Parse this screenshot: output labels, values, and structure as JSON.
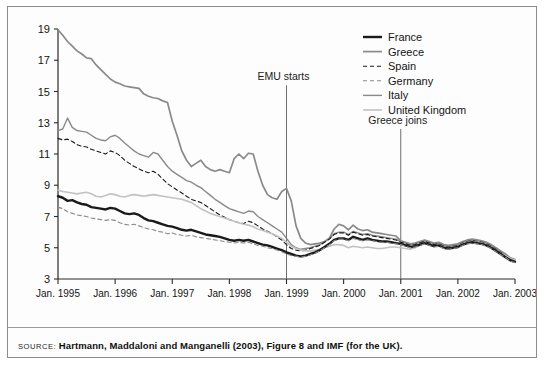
{
  "figure": {
    "source_tag": "SOURCE:",
    "source_text": "Hartmann, Maddaloni and Manganelli (2003), Figure 8 and IMF (for the UK)."
  },
  "legend": {
    "position": "top-right",
    "items": [
      {
        "label": "France",
        "color": "#1a1a1a",
        "width": 2.4,
        "dash": "none"
      },
      {
        "label": "Greece",
        "color": "#8a8a8a",
        "width": 1.7,
        "dash": "none"
      },
      {
        "label": "Spain",
        "color": "#1a1a1a",
        "width": 1.1,
        "dash": "4,3"
      },
      {
        "label": "Germany",
        "color": "#8a8a8a",
        "width": 1.1,
        "dash": "4,3"
      },
      {
        "label": "Italy",
        "color": "#8a8a8a",
        "width": 1.4,
        "dash": "none"
      },
      {
        "label": "United Kingdom",
        "color": "#c2c2c2",
        "width": 1.6,
        "dash": "none"
      }
    ]
  },
  "annotations": [
    {
      "name": "emu-starts",
      "text": "EMU starts",
      "x": 1999.0
    },
    {
      "name": "greece-joins",
      "text": "Greece joins",
      "x": 2001.0
    }
  ],
  "chart_data": {
    "type": "line",
    "title": "",
    "xlabel": "",
    "ylabel": "",
    "xlim": [
      1995.0,
      2003.0
    ],
    "ylim": [
      3,
      19
    ],
    "grid": false,
    "ytick_labels": [
      "3",
      "5",
      "7",
      "9",
      "11",
      "13",
      "15",
      "17",
      "19"
    ],
    "yticks": [
      3,
      5,
      7,
      9,
      11,
      13,
      15,
      17,
      19
    ],
    "xtick_labels": [
      "Jan. 1995",
      "Jan. 1996",
      "Jan. 1997",
      "Jan. 1998",
      "Jan. 1999",
      "Jan. 2000",
      "Jan. 2001",
      "Jan. 2002",
      "Jan. 2003"
    ],
    "xticks": [
      1995,
      1996,
      1997,
      1998,
      1999,
      2000,
      2001,
      2002,
      2003
    ],
    "x": [
      1995.0,
      1995.083,
      1995.167,
      1995.25,
      1995.333,
      1995.417,
      1995.5,
      1995.583,
      1995.667,
      1995.75,
      1995.833,
      1995.917,
      1996.0,
      1996.083,
      1996.167,
      1996.25,
      1996.333,
      1996.417,
      1996.5,
      1996.583,
      1996.667,
      1996.75,
      1996.833,
      1996.917,
      1997.0,
      1997.083,
      1997.167,
      1997.25,
      1997.333,
      1997.417,
      1997.5,
      1997.583,
      1997.667,
      1997.75,
      1997.833,
      1997.917,
      1998.0,
      1998.083,
      1998.167,
      1998.25,
      1998.333,
      1998.417,
      1998.5,
      1998.583,
      1998.667,
      1998.75,
      1998.833,
      1998.917,
      1999.0,
      1999.083,
      1999.167,
      1999.25,
      1999.333,
      1999.417,
      1999.5,
      1999.583,
      1999.667,
      1999.75,
      1999.833,
      1999.917,
      2000.0,
      2000.083,
      2000.167,
      2000.25,
      2000.333,
      2000.417,
      2000.5,
      2000.583,
      2000.667,
      2000.75,
      2000.833,
      2000.917,
      2001.0,
      2001.083,
      2001.167,
      2001.25,
      2001.333,
      2001.417,
      2001.5,
      2001.583,
      2001.667,
      2001.75,
      2001.833,
      2001.917,
      2002.0,
      2002.083,
      2002.167,
      2002.25,
      2002.333,
      2002.417,
      2002.5,
      2002.583,
      2002.667,
      2002.75,
      2002.833,
      2002.917,
      2003.0
    ],
    "series": [
      {
        "name": "Greece",
        "legend_ref": "Greece",
        "style": "thick-black-solid",
        "note": "Topmost line, starts near 19 and falls steeply to converge after EMU",
        "values": [
          18.95,
          18.6,
          18.2,
          17.9,
          17.6,
          17.4,
          17.15,
          17.1,
          16.7,
          16.4,
          16.1,
          15.8,
          15.6,
          15.5,
          15.35,
          15.3,
          15.25,
          15.2,
          14.85,
          14.7,
          14.6,
          14.55,
          14.4,
          14.3,
          13.1,
          12.2,
          11.2,
          10.6,
          10.2,
          10.4,
          10.6,
          10.2,
          10.0,
          9.9,
          10.0,
          9.9,
          9.8,
          10.7,
          11.0,
          10.7,
          11.05,
          11.0,
          9.9,
          9.0,
          8.4,
          8.2,
          8.1,
          8.6,
          8.8,
          8.0,
          6.4,
          5.6,
          5.3,
          5.2,
          5.25,
          5.3,
          5.4,
          5.6,
          6.2,
          6.5,
          6.4,
          6.15,
          6.45,
          6.2,
          6.1,
          6.15,
          6.0,
          5.95,
          5.9,
          5.85,
          5.8,
          5.75,
          5.45,
          5.35,
          5.25,
          5.3,
          5.4,
          5.5,
          5.4,
          5.3,
          5.35,
          5.2,
          5.15,
          5.2,
          5.25,
          5.4,
          5.5,
          5.55,
          5.5,
          5.45,
          5.35,
          5.2,
          5.0,
          4.8,
          4.6,
          4.35,
          4.25
        ]
      },
      {
        "name": "Italy",
        "legend_ref": "Italy",
        "style": "gray-solid",
        "note": "Starts ~12.5 with early 1995 spike to 13.3",
        "values": [
          12.5,
          12.6,
          13.3,
          12.7,
          12.5,
          12.45,
          12.4,
          12.2,
          12.0,
          11.9,
          11.85,
          12.1,
          12.2,
          12.0,
          11.7,
          11.45,
          11.2,
          11.0,
          10.9,
          10.8,
          11.1,
          11.0,
          10.6,
          10.2,
          9.9,
          9.7,
          9.5,
          9.3,
          9.2,
          9.0,
          8.85,
          8.6,
          8.35,
          8.1,
          7.9,
          7.7,
          7.5,
          7.4,
          7.3,
          7.2,
          7.35,
          7.3,
          7.0,
          6.8,
          6.6,
          6.4,
          6.2,
          6.0,
          5.6,
          5.2,
          5.0,
          4.9,
          4.95,
          5.0,
          5.1,
          5.2,
          5.4,
          5.6,
          5.9,
          6.0,
          6.0,
          5.85,
          6.05,
          5.95,
          5.85,
          5.9,
          5.8,
          5.75,
          5.7,
          5.65,
          5.6,
          5.55,
          5.4,
          5.3,
          5.2,
          5.25,
          5.35,
          5.45,
          5.35,
          5.25,
          5.3,
          5.15,
          5.1,
          5.15,
          5.2,
          5.35,
          5.45,
          5.5,
          5.45,
          5.4,
          5.3,
          5.15,
          4.95,
          4.75,
          4.55,
          4.3,
          4.2
        ]
      },
      {
        "name": "Spain",
        "legend_ref": "Spain",
        "style": "black-dashed",
        "note": "Starts ~12, below Italy, converges with others",
        "values": [
          12.0,
          11.9,
          11.95,
          11.8,
          11.6,
          11.5,
          11.45,
          11.3,
          11.2,
          11.1,
          11.0,
          11.2,
          11.1,
          10.9,
          10.6,
          10.4,
          10.2,
          10.05,
          9.9,
          9.8,
          9.9,
          9.7,
          9.4,
          9.1,
          8.9,
          8.7,
          8.5,
          8.3,
          8.1,
          8.0,
          7.9,
          7.7,
          7.5,
          7.3,
          7.1,
          6.95,
          6.8,
          6.7,
          6.6,
          6.55,
          6.7,
          6.6,
          6.4,
          6.2,
          6.05,
          5.9,
          5.7,
          5.5,
          5.2,
          4.95,
          4.85,
          4.8,
          4.85,
          4.95,
          5.05,
          5.15,
          5.35,
          5.55,
          5.85,
          5.95,
          5.95,
          5.8,
          6.0,
          5.9,
          5.8,
          5.85,
          5.75,
          5.7,
          5.65,
          5.6,
          5.55,
          5.5,
          5.35,
          5.25,
          5.15,
          5.2,
          5.3,
          5.4,
          5.3,
          5.2,
          5.25,
          5.1,
          5.05,
          5.1,
          5.15,
          5.3,
          5.4,
          5.45,
          5.4,
          5.35,
          5.25,
          5.1,
          4.9,
          4.7,
          4.5,
          4.25,
          4.15
        ]
      },
      {
        "name": "United Kingdom",
        "legend_ref": "United Kingdom",
        "style": "light-gray-solid",
        "note": "Flat near 8.5 until mid-1997, then declines; lowest around 2000",
        "values": [
          8.7,
          8.6,
          8.55,
          8.5,
          8.45,
          8.5,
          8.55,
          8.45,
          8.3,
          8.25,
          8.35,
          8.45,
          8.4,
          8.3,
          8.25,
          8.35,
          8.4,
          8.35,
          8.3,
          8.35,
          8.4,
          8.35,
          8.3,
          8.25,
          8.2,
          8.15,
          8.1,
          8.0,
          7.9,
          7.7,
          7.5,
          7.35,
          7.2,
          7.1,
          7.0,
          6.9,
          6.8,
          6.7,
          6.6,
          6.5,
          6.45,
          6.35,
          6.2,
          6.1,
          6.0,
          5.9,
          5.75,
          5.6,
          5.35,
          5.1,
          4.95,
          4.85,
          4.8,
          4.8,
          4.85,
          4.9,
          5.0,
          5.1,
          5.2,
          5.2,
          5.15,
          5.0,
          5.1,
          5.05,
          5.0,
          5.05,
          5.0,
          4.95,
          4.95,
          5.0,
          5.05,
          5.05,
          5.0,
          4.95,
          4.9,
          5.0,
          5.15,
          5.3,
          5.2,
          5.1,
          5.2,
          5.05,
          5.0,
          5.05,
          5.1,
          5.25,
          5.35,
          5.4,
          5.35,
          5.3,
          5.2,
          5.05,
          4.85,
          4.65,
          4.5,
          4.3,
          4.2
        ]
      },
      {
        "name": "France",
        "legend_ref": "France",
        "style": "thick-black-solid-lower",
        "note": "Lower thick black line starting ~8.3",
        "values": [
          8.3,
          8.2,
          8.0,
          8.05,
          7.9,
          7.8,
          7.75,
          7.6,
          7.55,
          7.5,
          7.45,
          7.55,
          7.5,
          7.35,
          7.2,
          7.15,
          7.2,
          7.1,
          6.9,
          6.75,
          6.7,
          6.6,
          6.5,
          6.4,
          6.35,
          6.25,
          6.15,
          6.1,
          6.15,
          6.05,
          5.95,
          5.85,
          5.8,
          5.75,
          5.7,
          5.6,
          5.5,
          5.45,
          5.5,
          5.45,
          5.5,
          5.4,
          5.3,
          5.2,
          5.15,
          5.05,
          4.95,
          4.85,
          4.7,
          4.6,
          4.5,
          4.45,
          4.5,
          4.6,
          4.7,
          4.85,
          5.05,
          5.25,
          5.5,
          5.6,
          5.6,
          5.5,
          5.7,
          5.6,
          5.5,
          5.6,
          5.5,
          5.45,
          5.4,
          5.4,
          5.35,
          5.3,
          5.25,
          5.15,
          5.05,
          5.1,
          5.2,
          5.3,
          5.2,
          5.1,
          5.15,
          5.0,
          4.95,
          5.0,
          5.05,
          5.2,
          5.3,
          5.35,
          5.3,
          5.25,
          5.15,
          5.0,
          4.8,
          4.6,
          4.4,
          4.2,
          4.1
        ]
      },
      {
        "name": "Germany",
        "legend_ref": "Germany",
        "style": "gray-dashed",
        "note": "Lowest of the core group early on, starting ~7.6",
        "values": [
          7.6,
          7.5,
          7.3,
          7.2,
          7.1,
          7.05,
          7.0,
          6.9,
          6.85,
          6.8,
          6.75,
          6.8,
          6.75,
          6.6,
          6.5,
          6.45,
          6.5,
          6.4,
          6.3,
          6.2,
          6.15,
          6.05,
          6.0,
          5.9,
          5.95,
          5.85,
          5.8,
          5.75,
          5.8,
          5.7,
          5.65,
          5.6,
          5.55,
          5.5,
          5.45,
          5.4,
          5.35,
          5.3,
          5.35,
          5.3,
          5.35,
          5.25,
          5.15,
          5.1,
          5.0,
          4.95,
          4.85,
          4.75,
          4.6,
          4.5,
          4.45,
          4.4,
          4.45,
          4.55,
          4.65,
          4.8,
          5.0,
          5.2,
          5.45,
          5.55,
          5.55,
          5.45,
          5.6,
          5.5,
          5.45,
          5.5,
          5.45,
          5.4,
          5.35,
          5.35,
          5.3,
          5.25,
          5.2,
          5.1,
          5.0,
          5.05,
          5.15,
          5.25,
          5.15,
          5.05,
          5.1,
          4.95,
          4.9,
          4.95,
          5.0,
          5.15,
          5.25,
          5.3,
          5.25,
          5.2,
          5.1,
          4.95,
          4.75,
          4.55,
          4.4,
          4.15,
          4.05
        ]
      }
    ]
  }
}
